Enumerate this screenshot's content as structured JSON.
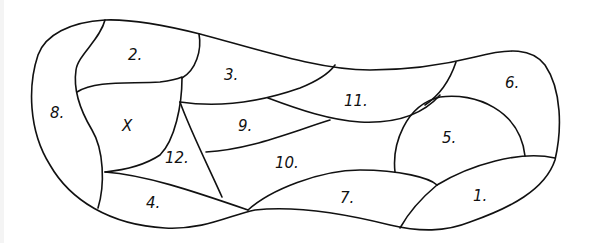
{
  "diagram": {
    "type": "region-map",
    "stroke_color": "#111111",
    "background": "#ffffff",
    "regions": [
      {
        "id": "r1",
        "label": "1.",
        "x": 473,
        "y": 201
      },
      {
        "id": "r2",
        "label": "2.",
        "x": 133,
        "y": 60
      },
      {
        "id": "r3",
        "label": "3.",
        "x": 229,
        "y": 77
      },
      {
        "id": "r4",
        "label": "4.",
        "x": 151,
        "y": 205
      },
      {
        "id": "r5",
        "label": "5.",
        "x": 450,
        "y": 140
      },
      {
        "id": "r6",
        "label": "6.",
        "x": 509,
        "y": 86
      },
      {
        "id": "r7",
        "label": "7.",
        "x": 349,
        "y": 200
      },
      {
        "id": "r8",
        "label": "8.",
        "x": 57,
        "y": 114
      },
      {
        "id": "r9",
        "label": "9.",
        "x": 244,
        "y": 128
      },
      {
        "id": "r10",
        "label": "10.",
        "x": 287,
        "y": 165
      },
      {
        "id": "r11",
        "label": "11.",
        "x": 358,
        "y": 103
      },
      {
        "id": "r12",
        "label": "12.",
        "x": 177,
        "y": 160
      },
      {
        "id": "rX",
        "label": "X",
        "x": 127,
        "y": 128
      }
    ]
  }
}
